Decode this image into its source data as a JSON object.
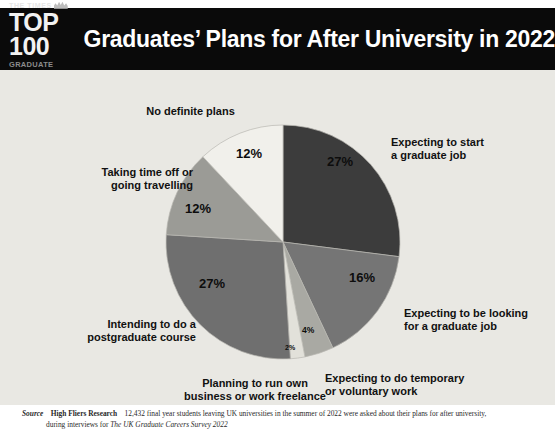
{
  "header": {
    "logo": {
      "masthead": "THE TIMES",
      "top100": "TOP 100",
      "subtitle": "GRADUATE EMPLOYERS"
    },
    "title": "Graduates’ Plans for After University in 2022"
  },
  "footer": {
    "source_label": "Source",
    "organisation": "High Fliers Research",
    "text_part1": "12,432 final year students leaving UK universities in the summer of 2022 were asked about their plans for after university,",
    "text_part2": "during interviews for ",
    "survey_name": "The UK Graduate Careers Survey 2022"
  },
  "chart_data": {
    "type": "pie",
    "title": "Graduates’ Plans for After University in 2022",
    "unit": "%",
    "start_angle_deg": 0,
    "direction": "clockwise",
    "legend": "labels-around-slices",
    "categories": [
      "Expecting to start a graduate job",
      "Expecting to be looking for a graduate job",
      "Expecting to do temporary or voluntary work",
      "Planning to run own business or work freelance",
      "Intending to do a postgraduate course",
      "Taking time off or going travelling",
      "No definite plans"
    ],
    "values": [
      27,
      16,
      4,
      2,
      27,
      12,
      12
    ],
    "colors": [
      "#3c3c3c",
      "#757575",
      "#a9a9a3",
      "#e2e1da",
      "#6f6f6f",
      "#9b9b96",
      "#f1f0eb"
    ],
    "slices": [
      {
        "label": "Expecting to start\na graduate job",
        "value": 27,
        "value_text": "27%",
        "color": "#3c3c3c"
      },
      {
        "label": "Expecting to be looking\nfor a graduate job",
        "value": 16,
        "value_text": "16%",
        "color": "#757575"
      },
      {
        "label": "Expecting to do temporary\nor voluntary work",
        "value": 4,
        "value_text": "4%",
        "color": "#a9a9a3"
      },
      {
        "label": "Planning to run own\nbusiness or work freelance",
        "value": 2,
        "value_text": "2%",
        "color": "#e2e1da"
      },
      {
        "label": "Intending to do a\npostgraduate course",
        "value": 27,
        "value_text": "27%",
        "color": "#6f6f6f"
      },
      {
        "label": "Taking time off or\ngoing travelling",
        "value": 12,
        "value_text": "12%",
        "color": "#9b9b96"
      },
      {
        "label": "No definite plans",
        "value": 12,
        "value_text": "12%",
        "color": "#f1f0eb"
      }
    ]
  }
}
